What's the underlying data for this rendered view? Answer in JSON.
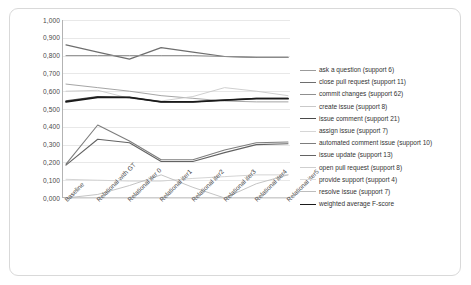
{
  "chart_data": {
    "type": "line",
    "title": "",
    "xlabel": "",
    "ylabel": "",
    "ylim": [
      0.0,
      1.0
    ],
    "grid": true,
    "legend_position": "right",
    "decimal_separator": ",",
    "categories": [
      "Baseline",
      "Relational with GT",
      "Relational iter 0",
      "Relational iter1",
      "Relational iter2",
      "Relational iter3",
      "Relational iter4",
      "Relational iter5"
    ],
    "ytick_labels": [
      "1,000",
      "0,900",
      "0,800",
      "0,700",
      "0,600",
      "0,500",
      "0,400",
      "0,300",
      "0,200",
      "0,100",
      "0,000"
    ],
    "ytick_values": [
      1.0,
      0.9,
      0.8,
      0.7,
      0.6,
      0.5,
      0.4,
      0.3,
      0.2,
      0.1,
      0.0
    ],
    "series": [
      {
        "name": "ask a question",
        "support": 6,
        "label": "ask a question  (support 6)",
        "color": "#9b9b9b",
        "width": 0.9,
        "values": [
          0.64,
          0.62,
          0.6,
          0.575,
          0.56,
          0.545,
          0.54,
          0.54
        ]
      },
      {
        "name": "close pull request",
        "support": 11,
        "label": "close pull request  (support 11)",
        "color": "#6e6e6e",
        "width": 1.2,
        "values": [
          0.86,
          0.82,
          0.78,
          0.845,
          0.82,
          0.795,
          0.79,
          0.79
        ]
      },
      {
        "name": "commit changes",
        "support": 62,
        "label": "commit changes  (support 62)",
        "color": "#8f8f8f",
        "width": 1.0,
        "values": [
          0.8,
          0.8,
          0.8,
          0.8,
          0.8,
          0.795,
          0.79,
          0.79
        ]
      },
      {
        "name": "create issue",
        "support": 8,
        "label": "create issue  (support 8)",
        "color": "#c9c9c9",
        "width": 0.9,
        "values": [
          0.6,
          0.605,
          0.56,
          0.545,
          0.57,
          0.62,
          0.6,
          0.575
        ]
      },
      {
        "name": "issue comment",
        "support": 21,
        "label": "issue comment  (support 21)",
        "color": "#4a4a4a",
        "width": 1.3,
        "values": [
          0.545,
          0.57,
          0.565,
          0.54,
          0.54,
          0.55,
          0.56,
          0.56
        ]
      },
      {
        "name": "assign issue",
        "support": 7,
        "label": "assign issue  (support 7)",
        "color": "#d6d6d6",
        "width": 0.9,
        "values": [
          0.0,
          0.0,
          0.0,
          0.0,
          0.0,
          0.0,
          0.0,
          0.0
        ]
      },
      {
        "name": "automated comment issue",
        "support": 10,
        "label": "automated comment issue  (support 10)",
        "color": "#7d7d7d",
        "width": 1.1,
        "values": [
          0.19,
          0.41,
          0.32,
          0.215,
          0.215,
          0.27,
          0.31,
          0.315
        ]
      },
      {
        "name": "issue update",
        "support": 13,
        "label": "issue update  (support 13)",
        "color": "#636363",
        "width": 1.1,
        "values": [
          0.185,
          0.33,
          0.31,
          0.205,
          0.205,
          0.255,
          0.3,
          0.305
        ]
      },
      {
        "name": "open pull request",
        "support": 8,
        "label": "open pull request  (support 8)",
        "color": "#cfcfcf",
        "width": 0.9,
        "values": [
          0.105,
          0.1,
          0.095,
          0.095,
          0.11,
          0.12,
          0.13,
          0.13
        ]
      },
      {
        "name": "provide support",
        "support": 4,
        "label": "provide support  (support 4)",
        "color": "#dcdcdc",
        "width": 0.9,
        "values": [
          0.0,
          0.0,
          0.0,
          0.0,
          0.0,
          0.0,
          0.0,
          0.0
        ]
      },
      {
        "name": "resolve issue",
        "support": 7,
        "label": "resolve issue  (support 7)",
        "color": "#bdbdbd",
        "width": 0.9,
        "values": [
          0.0,
          0.02,
          0.07,
          0.13,
          0.06,
          0.0,
          0.08,
          0.13
        ]
      },
      {
        "name": "weighted average F-score",
        "support": null,
        "label": "weighted average F-score",
        "color": "#1a1a1a",
        "width": 1.8,
        "values": [
          0.54,
          0.565,
          0.565,
          0.54,
          0.54,
          0.55,
          0.558,
          0.558
        ]
      }
    ]
  }
}
